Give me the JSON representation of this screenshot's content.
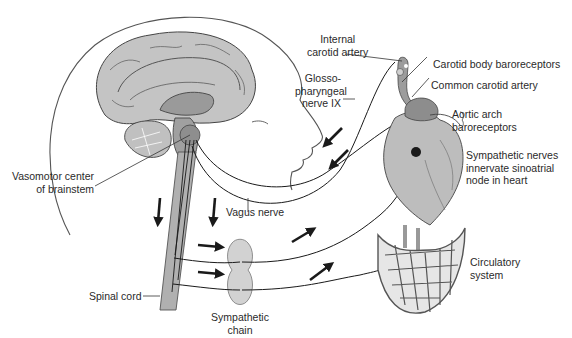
{
  "figure": {
    "type": "anatomical-diagram"
  },
  "labels": {
    "internal_carotid": [
      "Internal",
      "carotid artery"
    ],
    "carotid_body": "Carotid body baroreceptors",
    "common_carotid": "Common carotid artery",
    "glossopharyngeal": [
      "Glosso-",
      "pharyngeal",
      "nerve IX"
    ],
    "aortic_arch": [
      "Aortic arch",
      "baroreceptors"
    ],
    "sympathetic_nerves": [
      "Sympathetic nerves",
      "innervate sinoatrial",
      "node in heart"
    ],
    "vasomotor": [
      "Vasomotor center",
      "of brainstem"
    ],
    "vagus": "Vagus nerve",
    "circulatory": [
      "Circulatory",
      "system"
    ],
    "spinal_cord": "Spinal cord",
    "sympathetic_chain": [
      "Sympathetic",
      "chain"
    ]
  },
  "colors": {
    "tissue_light": "#c8c8c8",
    "tissue_mid": "#a9a9a9",
    "tissue_dark": "#8a8a8a",
    "line": "#1a1a1a"
  }
}
